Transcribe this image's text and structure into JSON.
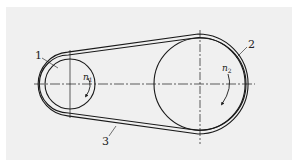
{
  "diagram": {
    "type": "belt-drive",
    "components": [
      {
        "id": "1",
        "label": "1",
        "name": "small pulley (driver)"
      },
      {
        "id": "2",
        "label": "2",
        "name": "large pulley (driven)"
      },
      {
        "id": "3",
        "label": "3",
        "name": "belt"
      }
    ],
    "speeds": [
      {
        "symbol": "n",
        "subscript": "1",
        "pulley": "1",
        "direction": "clockwise"
      },
      {
        "symbol": "n",
        "subscript": "2",
        "pulley": "2",
        "direction": "clockwise"
      }
    ]
  },
  "colors": {
    "line": "#1a1a1a",
    "background": "#f0f0f0",
    "page": "#ffffff"
  }
}
